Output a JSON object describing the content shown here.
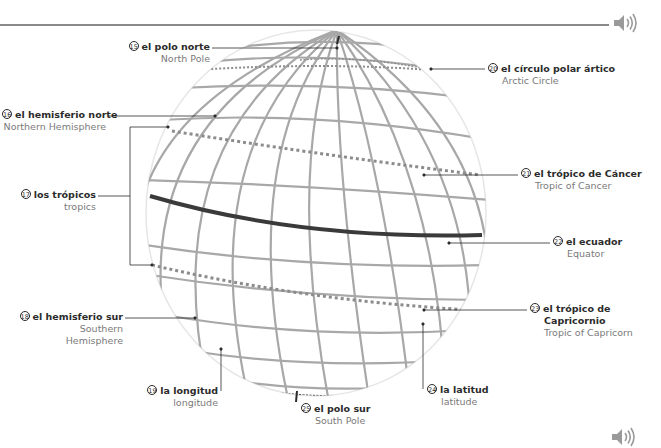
{
  "header": {
    "audio_icon": "speaker-icon"
  },
  "footer": {
    "audio_icon": "speaker-icon"
  },
  "labels": [
    {
      "id": "north-pole",
      "number": "15",
      "es": "el polo norte",
      "en": "North Pole"
    },
    {
      "id": "northern-hemisphere",
      "number": "16",
      "es": "el hemisferio norte",
      "en": "Northern Hemisphere"
    },
    {
      "id": "tropics",
      "number": "17",
      "es": "los trópicos",
      "en": "tropics"
    },
    {
      "id": "southern-hemisphere",
      "number": "18",
      "es": "el hemisferio sur",
      "en_line1": "Southern",
      "en_line2": "Hemisphere"
    },
    {
      "id": "longitude",
      "number": "19",
      "es": "la longitud",
      "en": "longitude"
    },
    {
      "id": "arctic-circle",
      "number": "20",
      "es": "el círculo polar ártico",
      "en": "Arctic Circle"
    },
    {
      "id": "tropic-of-cancer",
      "number": "21",
      "es": "el trópico de Cáncer",
      "en": "Tropic of Cancer"
    },
    {
      "id": "equator",
      "number": "22",
      "es": "el ecuador",
      "en": "Equator"
    },
    {
      "id": "tropic-of-capricorn",
      "number": "23",
      "es_line1": "el trópico de",
      "es_line2": "Capricornio",
      "en": "Tropic of Capricorn"
    },
    {
      "id": "latitude",
      "number": "24",
      "es": "la latitud",
      "en": "latitude"
    },
    {
      "id": "south-pole",
      "number": "25",
      "es": "el polo sur",
      "en": "South Pole"
    }
  ],
  "colors": {
    "rule": "#8a8a8a",
    "grid": "#a8a8a8",
    "equator": "#3a3a3a",
    "leader": "#2b2b2b",
    "text_es": "#2b2b2b",
    "text_en": "#7a7a7a"
  }
}
